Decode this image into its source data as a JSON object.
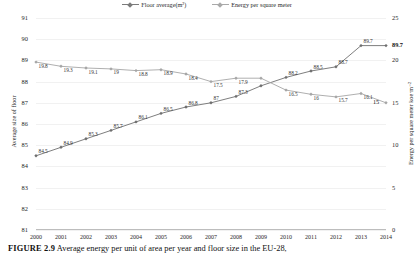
{
  "figure": {
    "caption_prefix": "FIGURE 2.9",
    "caption_text": "Average energy per unit of area per year and floor size in the EU-28,"
  },
  "legend": {
    "items": [
      {
        "label": "Floor average(m²)",
        "color": "#7b7b7b"
      },
      {
        "label": "Energy per square meter",
        "color": "#a9a9a9"
      }
    ]
  },
  "end_labels": {
    "floor": "89.7",
    "energy": "15"
  },
  "chart_data": {
    "type": "line",
    "title": "",
    "xlabel": "",
    "ylabel": "Average size of floor",
    "y2label": "Energy per square meter koe·m⁻²",
    "grid": true,
    "legend_position": "top-center",
    "categories": [
      "2000",
      "2001",
      "2002",
      "2003",
      "2004",
      "2005",
      "2006",
      "2007",
      "2008",
      "2009",
      "2010",
      "2011",
      "2012",
      "2013",
      "2014"
    ],
    "ylim": [
      81,
      91
    ],
    "yticks": [
      81,
      82,
      83,
      84,
      85,
      86,
      87,
      88,
      89,
      90,
      91
    ],
    "y2lim": [
      0,
      25
    ],
    "y2ticks": [
      0,
      5,
      10,
      15,
      20,
      25
    ],
    "series": [
      {
        "name": "Floor average(m²)",
        "axis": "left",
        "color": "#6f6f6f",
        "values": [
          84.5,
          84.9,
          85.3,
          85.7,
          86.1,
          86.5,
          86.8,
          87.0,
          87.3,
          87.8,
          88.2,
          88.5,
          88.7,
          89.7,
          89.7
        ],
        "labels": [
          "84.5",
          "84.9",
          "85.3",
          "85.7",
          "86.1",
          "86.5",
          "86.8",
          "87",
          "87.3",
          "",
          "88.2",
          "88.5",
          "88.7",
          "89.7",
          ""
        ]
      },
      {
        "name": "Energy per square meter",
        "axis": "right",
        "color": "#a6a6a6",
        "values": [
          19.8,
          19.3,
          19.1,
          19.0,
          18.8,
          18.9,
          18.4,
          17.5,
          17.9,
          17.9,
          16.5,
          16.0,
          15.7,
          16.1,
          15.0
        ],
        "labels": [
          "19.8",
          "19.3",
          "19.1",
          "19",
          "18.8",
          "18.9",
          "18.4",
          "17.5",
          "17.9",
          "",
          "16.5",
          "16",
          "15.7",
          "16.1",
          ""
        ]
      }
    ]
  }
}
